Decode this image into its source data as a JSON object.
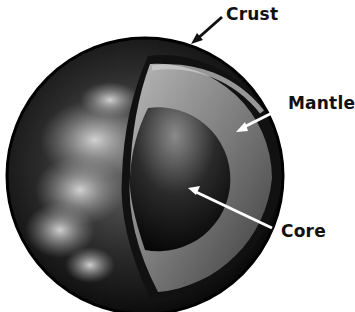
{
  "diagram": {
    "labels": {
      "crust": "Crust",
      "mantle": "Mantle",
      "core": "Core"
    },
    "colors": {
      "background": "#ffffff",
      "label_text": "#111111",
      "crust_arrow": "#111111",
      "inner_arrows": "#ffffff"
    }
  }
}
